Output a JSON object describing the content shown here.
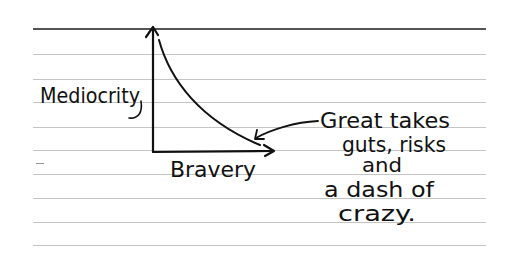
{
  "diagram": {
    "y_axis_label": "Mediocrity",
    "x_axis_label": "Bravery",
    "annotation": {
      "lines": [
        "Great takes",
        "guts, risks",
        "and",
        "a dash of",
        "crazy."
      ]
    },
    "curve": "decreasing-convex",
    "colors": {
      "ink": "#111111",
      "rule_lines": "#c4c4c4",
      "top_rule": "#555555",
      "paper": "#ffffff"
    }
  },
  "paper": {
    "rule_line_y": [
      29,
      54,
      79,
      102,
      127,
      150,
      174,
      198,
      222,
      245
    ]
  }
}
